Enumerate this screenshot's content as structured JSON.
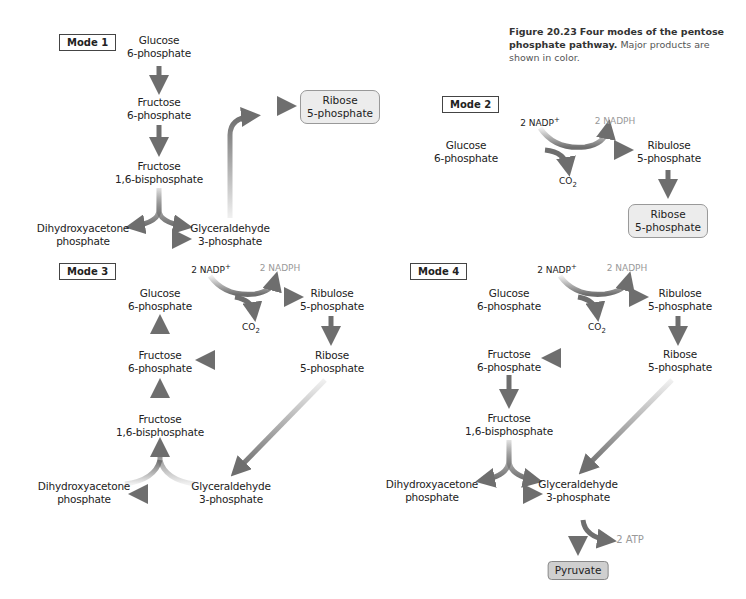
{
  "caption": {
    "figure_label": "Figure 20.23",
    "title": "Four modes of the pentose phosphate pathway.",
    "text": "Major products are shown in color."
  },
  "mode1": {
    "label": "Mode 1",
    "glucose6p": [
      "Glucose",
      "6-phosphate"
    ],
    "fructose6p": [
      "Fructose",
      "6-phosphate"
    ],
    "fructose16bp": [
      "Fructose",
      "1,6-bisphosphate"
    ],
    "dhap": [
      "Dihydroxyacetone",
      "phosphate"
    ],
    "g3p": [
      "Glyceraldehyde",
      "3-phosphate"
    ],
    "ribose5p": [
      "Ribose",
      "5-phosphate"
    ]
  },
  "mode2": {
    "label": "Mode 2",
    "nadp": "2 NADP",
    "nadp_sup": "+",
    "nadph": "2 NADPH",
    "co2": "CO",
    "co2_sub": "2",
    "glucose6p": [
      "Glucose",
      "6-phosphate"
    ],
    "ribulose5p": [
      "Ribulose",
      "5-phosphate"
    ],
    "ribose5p": [
      "Ribose",
      "5-phosphate"
    ]
  },
  "mode3": {
    "label": "Mode 3",
    "nadp": "2 NADP",
    "nadp_sup": "+",
    "nadph": "2 NADPH",
    "co2": "CO",
    "co2_sub": "2",
    "glucose6p": [
      "Glucose",
      "6-phosphate"
    ],
    "ribulose5p": [
      "Ribulose",
      "5-phosphate"
    ],
    "ribose5p": [
      "Ribose",
      "5-phosphate"
    ],
    "fructose6p": [
      "Fructose",
      "6-phosphate"
    ],
    "fructose16bp": [
      "Fructose",
      "1,6-bisphosphate"
    ],
    "dhap": [
      "Dihydroxyacetone",
      "phosphate"
    ],
    "g3p": [
      "Glyceraldehyde",
      "3-phosphate"
    ]
  },
  "mode4": {
    "label": "Mode 4",
    "nadp": "2 NADP",
    "nadp_sup": "+",
    "nadph": "2 NADPH",
    "co2": "CO",
    "co2_sub": "2",
    "glucose6p": [
      "Glucose",
      "6-phosphate"
    ],
    "ribulose5p": [
      "Ribulose",
      "5-phosphate"
    ],
    "ribose5p": [
      "Ribose",
      "5-phosphate"
    ],
    "fructose6p": [
      "Fructose",
      "6-phosphate"
    ],
    "fructose16bp": [
      "Fructose",
      "1,6-bisphosphate"
    ],
    "dhap": [
      "Dihydroxyacetone",
      "phosphate"
    ],
    "g3p": [
      "Glyceraldehyde",
      "3-phosphate"
    ],
    "atp": "2 ATP",
    "pyruvate": "Pyruvate"
  },
  "colors": {
    "arrow": "#6e6e6e",
    "product_box": "#ececec",
    "pyruvate_box": "#cfcfcf",
    "product_text_gray": "#999999"
  }
}
